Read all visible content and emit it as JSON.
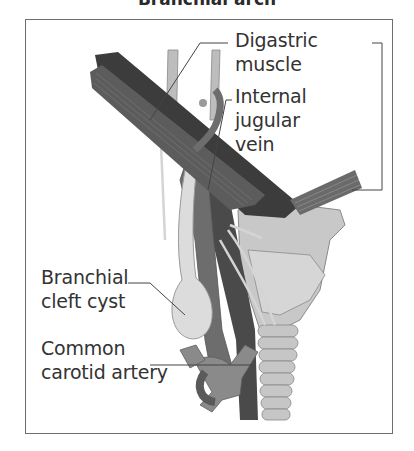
{
  "figure": {
    "title": "Branchial arch",
    "labels": {
      "digastric_line1": "Digastric",
      "digastric_line2": "muscle",
      "ijv_line1": "Internal",
      "ijv_line2": "jugular",
      "ijv_line3": "vein",
      "cyst_line1": "Branchial",
      "cyst_line2": "cleft cyst",
      "cca_line1": "Common",
      "cca_line2": "carotid artery"
    },
    "colors": {
      "frame": "#6e6e6e",
      "muscle_dark": "#3a3a3a",
      "muscle_mid": "#5c5c5c",
      "vessel": "#6d6d6d",
      "artery_dark": "#4a4a4a",
      "cartilage": "#c8c8c8",
      "cyst": "#d9d9d9",
      "nerve": "#d0d0d0",
      "text": "#333333"
    }
  }
}
